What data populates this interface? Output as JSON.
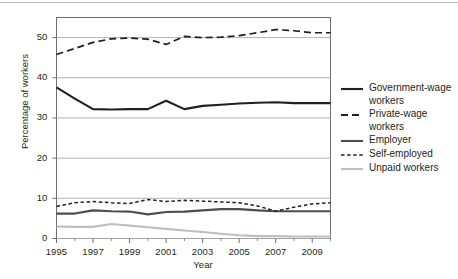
{
  "chart_data": {
    "type": "line",
    "title": "",
    "xlabel": "Year",
    "ylabel": "Percentage of workers",
    "xlim": [
      1995,
      2010
    ],
    "ylim": [
      0,
      55
    ],
    "ytick_values": [
      0,
      10,
      20,
      30,
      40,
      50
    ],
    "ytick_labels": [
      "0",
      "10",
      "20",
      "30",
      "40",
      "50"
    ],
    "xtick_values": [
      1995,
      1997,
      1999,
      2001,
      2003,
      2005,
      2007,
      2009
    ],
    "xtick_labels": [
      "1995",
      "1997",
      "1999",
      "2001",
      "2003",
      "2005",
      "2007",
      "2009"
    ],
    "minor_xticks": [
      1996,
      1998,
      2000,
      2002,
      2004,
      2006,
      2008,
      2010
    ],
    "grid": "horizontal",
    "legend_position": "right",
    "x": [
      1995,
      1996,
      1997,
      1998,
      1999,
      2000,
      2001,
      2002,
      2003,
      2004,
      2005,
      2006,
      2007,
      2008,
      2009,
      2010
    ],
    "series": [
      {
        "name": "Government-wage workers",
        "style": "solid",
        "color": "#231f20",
        "width": 2.1,
        "values": [
          37.6,
          34.8,
          32.2,
          32.1,
          32.2,
          32.2,
          34.3,
          32.2,
          33.0,
          33.3,
          33.6,
          33.8,
          33.9,
          33.7,
          33.7,
          33.7
        ]
      },
      {
        "name": "Private-wage workers",
        "style": "dashed",
        "color": "#231f20",
        "width": 1.7,
        "values": [
          45.8,
          47.3,
          48.8,
          49.7,
          49.9,
          49.6,
          48.3,
          50.3,
          50.0,
          50.1,
          50.5,
          51.2,
          52.0,
          51.7,
          51.2,
          51.2
        ]
      },
      {
        "name": "Employer",
        "style": "solid",
        "color": "#4d4d4f",
        "width": 2.1,
        "values": [
          6.2,
          6.2,
          7.0,
          6.8,
          6.7,
          6.0,
          6.6,
          6.7,
          7.0,
          7.3,
          7.3,
          7.0,
          6.8,
          6.8,
          6.8,
          6.8
        ]
      },
      {
        "name": "Self-employed",
        "style": "dotted-dash",
        "color": "#231f20",
        "width": 1.5,
        "values": [
          8.0,
          8.9,
          9.2,
          8.9,
          8.7,
          9.7,
          9.2,
          9.5,
          9.3,
          9.1,
          8.9,
          8.1,
          6.8,
          7.8,
          8.6,
          8.9
        ]
      },
      {
        "name": "Unpaid workers",
        "style": "solid",
        "color": "#bcbec0",
        "width": 2.1,
        "values": [
          3.0,
          2.9,
          2.9,
          3.6,
          3.2,
          2.8,
          2.4,
          2.0,
          1.6,
          1.2,
          0.8,
          0.6,
          0.6,
          0.5,
          0.5,
          0.5
        ]
      }
    ]
  },
  "legend": {
    "items": [
      {
        "label_line1": "Government-wage",
        "label_line2": "workers",
        "swatch": "solid-dark"
      },
      {
        "label_line1": "Private-wage",
        "label_line2": "workers",
        "swatch": "dashed-dark"
      },
      {
        "label_line1": "Employer",
        "label_line2": "",
        "swatch": "solid-gray"
      },
      {
        "label_line1": "Self-employed",
        "label_line2": "",
        "swatch": "dotted-dark"
      },
      {
        "label_line1": "Unpaid workers",
        "label_line2": "",
        "swatch": "solid-light"
      }
    ]
  },
  "colors": {
    "dark": "#231f20",
    "mid_gray": "#4d4d4f",
    "light_gray": "#bcbec0",
    "grid": "#a7a9ac",
    "frame": "#6d6e71"
  }
}
